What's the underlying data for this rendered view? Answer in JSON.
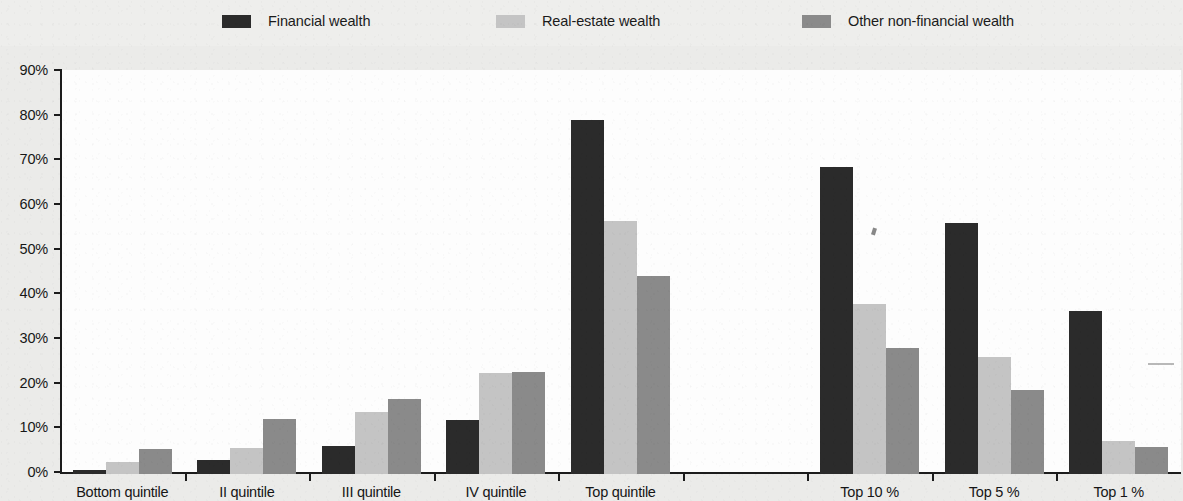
{
  "legend": {
    "entries": [
      {
        "label": "Financial wealth",
        "color": "#2b2b2b",
        "swatch": "legend-swatch-financial"
      },
      {
        "label": "Real-estate wealth",
        "color": "#c4c4c4",
        "swatch": "legend-swatch-real-estate"
      },
      {
        "label": "Other non-financial wealth",
        "color": "#8a8a8a",
        "swatch": "legend-swatch-other"
      }
    ]
  },
  "axes": {
    "y_ticks": [
      "0%",
      "10%",
      "20%",
      "30%",
      "40%",
      "50%",
      "60%",
      "70%",
      "80%",
      "90%"
    ],
    "x_categories": [
      "Bottom quintile",
      "II quintile",
      "III quintile",
      "IV quintile",
      "Top quintile",
      "",
      "Top 10 %",
      "Top 5 %",
      "Top 1 %"
    ]
  },
  "chart_data": {
    "type": "bar",
    "title": "",
    "xlabel": "",
    "ylabel": "",
    "ylim": [
      0,
      90
    ],
    "ytick_step": 10,
    "grid": false,
    "legend_position": "top",
    "value_unit": "percent",
    "categories": [
      "Bottom quintile",
      "II quintile",
      "III quintile",
      "IV quintile",
      "Top quintile",
      "",
      "Top 10 %",
      "Top 5 %",
      "Top 1 %"
    ],
    "series": [
      {
        "name": "Financial wealth",
        "color": "#2b2b2b",
        "values": [
          1.0,
          3.2,
          6.2,
          12.0,
          79.3,
          null,
          68.7,
          56.2,
          36.5
        ]
      },
      {
        "name": "Real-estate wealth",
        "color": "#c4c4c4",
        "values": [
          2.6,
          5.9,
          13.8,
          22.7,
          56.6,
          null,
          38.0,
          26.2,
          7.3
        ]
      },
      {
        "name": "Other non-financial wealth",
        "color": "#8a8a8a",
        "values": [
          5.6,
          12.4,
          16.7,
          22.8,
          44.4,
          null,
          28.2,
          18.7,
          6.0
        ]
      }
    ]
  }
}
